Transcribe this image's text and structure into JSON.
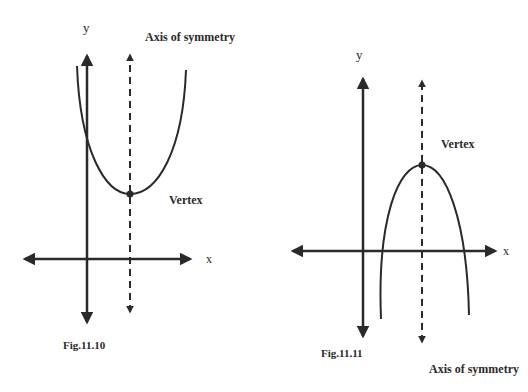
{
  "figures": [
    {
      "id": "fig-11-10",
      "caption": "Fig.11.10",
      "orientation": "opens-up",
      "axis_labels": {
        "x": "x",
        "y": "y"
      },
      "vertex_label": "Vertex",
      "symmetry_label": "Axis of symmetry"
    },
    {
      "id": "fig-11-11",
      "caption": "Fig.11.11",
      "orientation": "opens-down",
      "axis_labels": {
        "x": "x",
        "y": "y"
      },
      "vertex_label": "Vertex",
      "symmetry_label": "Axis of symmetry"
    }
  ],
  "colors": {
    "stroke": "#2a2a2a",
    "background": "#ffffff"
  }
}
